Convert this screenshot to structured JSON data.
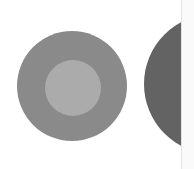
{
  "graphic": {
    "ring": {
      "outer": {
        "cx": 72,
        "cy": 86,
        "r": 55,
        "color": "#8a8a8a"
      },
      "inner": {
        "cx": 73,
        "cy": 88,
        "r": 28,
        "color": "#ababab"
      }
    },
    "half_circle": {
      "cx": 214,
      "cy": 84,
      "r": 70,
      "color": "#636363"
    },
    "divider_x": 181,
    "background": "#ffffff"
  }
}
